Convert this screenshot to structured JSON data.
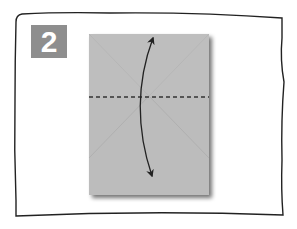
{
  "diagram": {
    "step_number": "2",
    "badge_color": "#8e8e8e",
    "paper_color": "#bcbcbc",
    "crease_color": "#b0b0b0",
    "frame_color": "#222222",
    "fold_line": "dashed horizontal valley fold across middle",
    "arrow": "curved double-headed arrow indicating fold up and unfold"
  }
}
